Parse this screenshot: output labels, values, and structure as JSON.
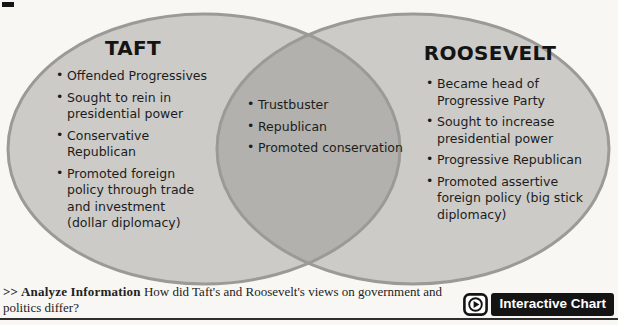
{
  "diagram": {
    "left": {
      "title": "TAFT",
      "items": [
        "Offended Progressives",
        "Sought to rein in presidential power",
        "Conservative Republican",
        "Promoted foreign policy through trade and investment (dollar diplomacy)"
      ]
    },
    "shared": {
      "items": [
        "Trustbuster",
        "Republican",
        "Promoted conservation"
      ]
    },
    "right": {
      "title": "ROOSEVELT",
      "items": [
        "Became head of Progressive Party",
        "Sought to increase presidential power",
        "Progressive Republican",
        "Promoted assertive foreign policy (big stick diplomacy)"
      ]
    },
    "colors": {
      "circle_fill": "#cccbc8",
      "overlap_fill": "#b2b1ae",
      "circle_stroke": "#9b9a97"
    }
  },
  "caption": {
    "prefix": ">> Analyze Information",
    "question": "How did Taft's and Roosevelt's views on government and politics differ?"
  },
  "interactive_chart": {
    "label": "Interactive Chart",
    "icon": "play-icon"
  }
}
